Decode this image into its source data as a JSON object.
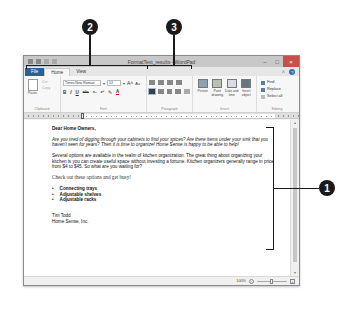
{
  "callouts": [
    {
      "number": "2",
      "target": "font-group"
    },
    {
      "number": "3",
      "target": "paragraph-group"
    },
    {
      "number": "1",
      "target": "document-body"
    }
  ],
  "window": {
    "title": "FormatText_results - WordPad",
    "controls": {
      "minimize": "–",
      "maximize": "□",
      "close": "×"
    },
    "quick_access": [
      "save",
      "undo",
      "redo",
      "customize"
    ]
  },
  "tabs": [
    {
      "label": "File",
      "state": "file"
    },
    {
      "label": "Home",
      "state": "active"
    },
    {
      "label": "View",
      "state": "normal"
    }
  ],
  "ribbon": {
    "clipboard": {
      "label": "Clipboard",
      "paste": "Paste",
      "cut": "Cut",
      "copy": "Copy"
    },
    "font": {
      "label": "Font",
      "font_name": "Times New Roman",
      "font_size": "12",
      "grow": "A˄",
      "shrink": "A˅",
      "format_buttons": [
        "B",
        "I",
        "U",
        "abc",
        "x₂",
        "x²",
        "✎",
        "A"
      ]
    },
    "paragraph": {
      "label": "Paragraph"
    },
    "insert": {
      "label": "Insert",
      "items": [
        {
          "label": "Picture"
        },
        {
          "label": "Paint drawing"
        },
        {
          "label": "Date and time"
        },
        {
          "label": "Insert object"
        }
      ]
    },
    "editing": {
      "label": "Editing",
      "items": [
        {
          "label": "Find"
        },
        {
          "label": "Replace"
        },
        {
          "label": "Select all"
        }
      ]
    }
  },
  "document": {
    "salutation": "Dear Home Owners,",
    "para1": "Are you tired of digging through your cabinets to find your spices? Are there items under your sink that you haven't seen for years? Then it is time to organize! Home Sense is happy to be able to help!",
    "para2": "Several options are available in the realm of kitchen organization. The great thing about organizing your kitchen is you can create useful space without investing a fortune. Kitchen organizers generally range in price from $4 to $45. So what are you waiting for?",
    "para3": "Check out these options and get busy!",
    "bullets": [
      "Connecting trays",
      "Adjustable shelves",
      "Adjustable racks"
    ],
    "signature_name": "Tim Todd",
    "signature_company": "Home Sense, Inc."
  },
  "statusbar": {
    "zoom_level": "100%",
    "zoom_out": "−",
    "zoom_in": "+"
  }
}
